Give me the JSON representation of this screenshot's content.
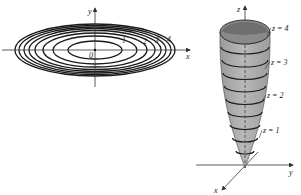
{
  "colors": {
    "ink": "#1a1a1a",
    "axis": "#333333",
    "surface_fill": "#a9a9a9",
    "surface_inner": "#7d7d7d",
    "rim_fill": "#8a8a8a",
    "background": "#ffffff"
  },
  "contour_plot": {
    "origin": [
      95,
      50
    ],
    "x_axis": {
      "from": 2,
      "to": 190,
      "label": "x"
    },
    "y_axis": {
      "from": 8,
      "to": 87,
      "label": "y"
    },
    "origin_label": "0",
    "ellipses": [
      {
        "rx": 27,
        "ry": 9
      },
      {
        "rx": 42,
        "ry": 14
      },
      {
        "rx": 52,
        "ry": 17
      },
      {
        "rx": 60,
        "ry": 19.5
      },
      {
        "rx": 66,
        "ry": 21.5
      },
      {
        "rx": 71,
        "ry": 23
      },
      {
        "rx": 76,
        "ry": 24.5
      },
      {
        "rx": 80,
        "ry": 26
      }
    ],
    "level_labels": [
      {
        "text": "1",
        "x": 122,
        "y": 43
      },
      {
        "text": "2",
        "x": 143,
        "y": 44
      },
      {
        "text": "3",
        "x": 155,
        "y": 43
      },
      {
        "text": "4",
        "x": 167,
        "y": 42
      }
    ]
  },
  "surface_plot": {
    "vertex": [
      245,
      168
    ],
    "z_axis": {
      "x": 245,
      "top": 6,
      "label": "z"
    },
    "y_axis": {
      "y": 165,
      "from": 196,
      "to": 293,
      "label": "y"
    },
    "x_axis": {
      "from": [
        258,
        152
      ],
      "to": [
        222,
        190
      ],
      "label": "x"
    },
    "top_rim": {
      "cx": 245,
      "cy": 32,
      "rx": 25,
      "ry": 12
    },
    "traces": [
      {
        "cy": 47,
        "rx": 24,
        "ry": 7
      },
      {
        "cy": 60,
        "rx": 23,
        "ry": 7
      },
      {
        "cy": 73,
        "rx": 22,
        "ry": 6.5
      },
      {
        "cy": 86,
        "rx": 20.5,
        "ry": 6
      },
      {
        "cy": 99,
        "rx": 19,
        "ry": 5.5
      },
      {
        "cy": 112,
        "rx": 17,
        "ry": 5
      },
      {
        "cy": 125,
        "rx": 15,
        "ry": 4.5
      },
      {
        "cy": 138,
        "rx": 12.5,
        "ry": 4
      },
      {
        "cy": 151,
        "rx": 9,
        "ry": 3
      }
    ],
    "labels": [
      {
        "text": "z = 4",
        "x": 272,
        "y": 31,
        "tip": [
          269,
          36
        ]
      },
      {
        "text": "z = 3",
        "x": 271,
        "y": 65,
        "tip": [
          267,
          69
        ]
      },
      {
        "text": "z = 2",
        "x": 267,
        "y": 98,
        "tip": [
          264,
          102
        ]
      },
      {
        "text": "z = 1",
        "x": 263,
        "y": 133,
        "tip": [
          261,
          138
        ]
      }
    ]
  }
}
